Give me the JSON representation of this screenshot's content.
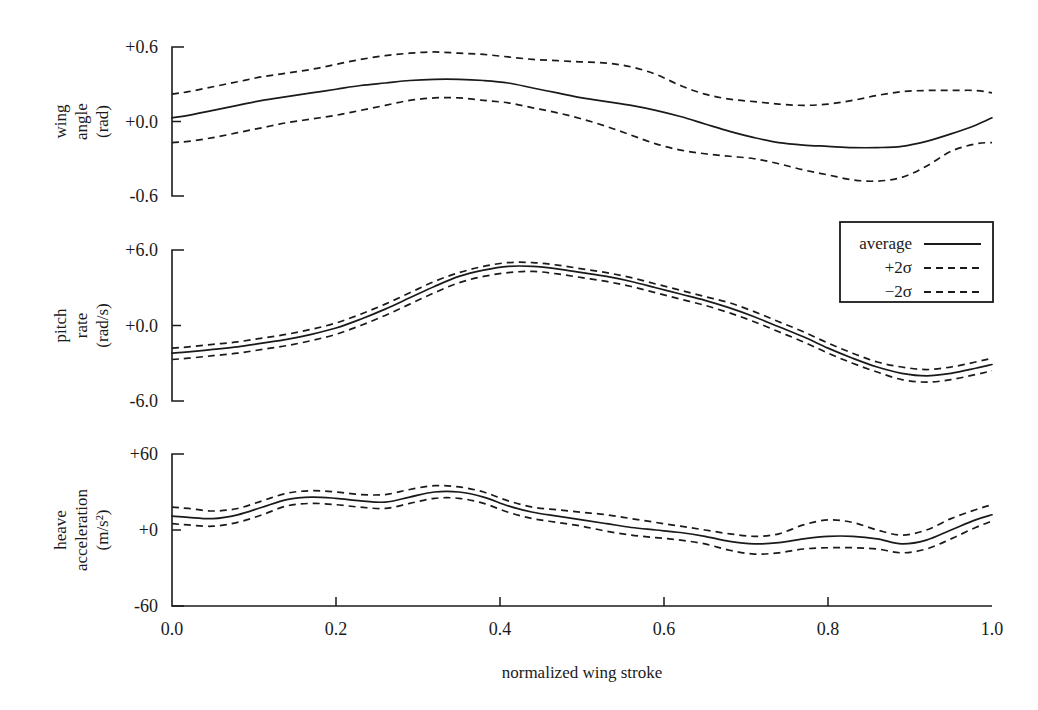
{
  "figure": {
    "background_color": "#ffffff",
    "line_color": "#1a1a1a",
    "xlabel": "normalized wing stroke"
  },
  "legend": {
    "position": "upper-right",
    "entries": [
      {
        "label": "average",
        "style": "solid"
      },
      {
        "label": "+2σ",
        "style": "dashed"
      },
      {
        "label": "−2σ",
        "style": "dashed"
      }
    ]
  },
  "chart_data": {
    "type": "line",
    "title": "",
    "xlabel": "normalized wing stroke",
    "xlim": [
      0.0,
      1.0
    ],
    "xticks": [
      0.0,
      0.2,
      0.4,
      0.6,
      0.8,
      1.0
    ],
    "xticklabels": [
      "0.0",
      "0.2",
      "0.4",
      "0.6",
      "0.8",
      "1.0"
    ],
    "grid": false,
    "legend_position": "upper-right",
    "panels": [
      {
        "name": "wing-angle",
        "ylabel_lines": [
          "wing",
          "angle",
          "(rad)"
        ],
        "ylabel": "wing angle (rad)",
        "units": "rad",
        "ylim": [
          -0.6,
          0.6
        ],
        "yticks": [
          -0.6,
          0.0,
          0.6
        ],
        "yticklabels": [
          "-0.6",
          "+0.0",
          "+0.6"
        ],
        "x": [
          0.0,
          0.02,
          0.05,
          0.08,
          0.11,
          0.14,
          0.17,
          0.2,
          0.23,
          0.26,
          0.29,
          0.32,
          0.35,
          0.38,
          0.41,
          0.44,
          0.47,
          0.5,
          0.53,
          0.56,
          0.59,
          0.62,
          0.65,
          0.68,
          0.71,
          0.74,
          0.77,
          0.8,
          0.83,
          0.86,
          0.89,
          0.92,
          0.95,
          0.98,
          1.0
        ],
        "series": [
          {
            "name": "average",
            "style": "solid",
            "values": [
              0.03,
              0.05,
              0.09,
              0.13,
              0.17,
              0.2,
              0.23,
              0.26,
              0.29,
              0.31,
              0.33,
              0.34,
              0.34,
              0.33,
              0.31,
              0.27,
              0.23,
              0.19,
              0.16,
              0.13,
              0.09,
              0.04,
              -0.02,
              -0.08,
              -0.13,
              -0.17,
              -0.19,
              -0.2,
              -0.21,
              -0.21,
              -0.2,
              -0.16,
              -0.1,
              -0.03,
              0.03
            ]
          },
          {
            "name": "+2σ",
            "style": "dashed",
            "values": [
              0.22,
              0.24,
              0.28,
              0.32,
              0.36,
              0.39,
              0.42,
              0.46,
              0.5,
              0.53,
              0.55,
              0.56,
              0.55,
              0.54,
              0.52,
              0.5,
              0.49,
              0.48,
              0.47,
              0.44,
              0.38,
              0.29,
              0.22,
              0.18,
              0.16,
              0.14,
              0.13,
              0.14,
              0.17,
              0.21,
              0.24,
              0.25,
              0.25,
              0.25,
              0.23
            ]
          },
          {
            "name": "−2σ",
            "style": "dashed",
            "values": [
              -0.17,
              -0.16,
              -0.13,
              -0.09,
              -0.05,
              -0.01,
              0.02,
              0.05,
              0.09,
              0.13,
              0.17,
              0.19,
              0.19,
              0.17,
              0.15,
              0.11,
              0.07,
              0.02,
              -0.04,
              -0.11,
              -0.18,
              -0.23,
              -0.26,
              -0.28,
              -0.3,
              -0.34,
              -0.39,
              -0.43,
              -0.47,
              -0.48,
              -0.45,
              -0.36,
              -0.24,
              -0.18,
              -0.17
            ]
          }
        ]
      },
      {
        "name": "pitch-rate",
        "ylabel_lines": [
          "pitch",
          "rate",
          "(rad/s)"
        ],
        "ylabel": "pitch rate (rad/s)",
        "units": "rad/s",
        "ylim": [
          -6.0,
          6.0
        ],
        "yticks": [
          -6.0,
          0.0,
          6.0
        ],
        "yticklabels": [
          "-6.0",
          "+0.0",
          "+6.0"
        ],
        "x": [
          0.0,
          0.02,
          0.05,
          0.08,
          0.11,
          0.14,
          0.17,
          0.2,
          0.23,
          0.26,
          0.29,
          0.32,
          0.35,
          0.38,
          0.41,
          0.44,
          0.47,
          0.5,
          0.53,
          0.56,
          0.59,
          0.62,
          0.65,
          0.68,
          0.71,
          0.74,
          0.77,
          0.8,
          0.83,
          0.86,
          0.89,
          0.92,
          0.95,
          0.98,
          1.0
        ],
        "series": [
          {
            "name": "average",
            "style": "solid",
            "values": [
              -2.2,
              -2.1,
              -1.9,
              -1.7,
              -1.4,
              -1.1,
              -0.7,
              -0.2,
              0.5,
              1.3,
              2.2,
              3.1,
              3.9,
              4.4,
              4.7,
              4.7,
              4.5,
              4.2,
              3.9,
              3.5,
              3.0,
              2.5,
              2.0,
              1.4,
              0.7,
              -0.1,
              -0.9,
              -1.8,
              -2.6,
              -3.3,
              -3.8,
              -4.0,
              -3.8,
              -3.4,
              -3.1
            ]
          },
          {
            "name": "+2σ",
            "style": "dashed",
            "values": [
              -1.8,
              -1.7,
              -1.5,
              -1.3,
              -1.0,
              -0.7,
              -0.3,
              0.2,
              0.9,
              1.7,
              2.6,
              3.5,
              4.2,
              4.7,
              5.0,
              5.0,
              4.8,
              4.5,
              4.2,
              3.8,
              3.3,
              2.8,
              2.3,
              1.8,
              1.1,
              0.3,
              -0.5,
              -1.4,
              -2.2,
              -2.9,
              -3.3,
              -3.5,
              -3.3,
              -2.9,
              -2.6
            ]
          },
          {
            "name": "−2σ",
            "style": "dashed",
            "values": [
              -2.7,
              -2.6,
              -2.4,
              -2.2,
              -1.9,
              -1.6,
              -1.2,
              -0.7,
              0.0,
              0.8,
              1.7,
              2.6,
              3.4,
              3.9,
              4.2,
              4.3,
              4.1,
              3.8,
              3.5,
              3.1,
              2.6,
              2.1,
              1.6,
              1.0,
              0.3,
              -0.5,
              -1.3,
              -2.2,
              -3.0,
              -3.7,
              -4.3,
              -4.5,
              -4.3,
              -3.9,
              -3.6
            ]
          }
        ]
      },
      {
        "name": "heave-acceleration",
        "ylabel_lines": [
          "heave",
          "acceleration",
          "(m/s²)"
        ],
        "ylabel": "heave acceleration (m/s^2)",
        "units": "m/s^2",
        "ylim": [
          -60,
          60
        ],
        "yticks": [
          -60,
          0,
          60
        ],
        "yticklabels": [
          "-60",
          "+0",
          "+60"
        ],
        "x": [
          0.0,
          0.02,
          0.05,
          0.08,
          0.11,
          0.14,
          0.17,
          0.2,
          0.23,
          0.26,
          0.29,
          0.32,
          0.35,
          0.38,
          0.41,
          0.44,
          0.47,
          0.5,
          0.53,
          0.56,
          0.59,
          0.62,
          0.65,
          0.68,
          0.71,
          0.74,
          0.77,
          0.8,
          0.83,
          0.86,
          0.89,
          0.92,
          0.95,
          0.98,
          1.0
        ],
        "series": [
          {
            "name": "average",
            "style": "solid",
            "values": [
              11,
              10,
              9,
              12,
              18,
              24,
              26,
              25,
              23,
              22,
              26,
              30,
              30,
              26,
              19,
              14,
              11,
              8,
              5,
              2,
              0,
              -2,
              -5,
              -9,
              -11,
              -10,
              -7,
              -5,
              -5,
              -7,
              -11,
              -8,
              0,
              8,
              12
            ]
          },
          {
            "name": "+2σ",
            "style": "dashed",
            "values": [
              18,
              17,
              15,
              17,
              23,
              29,
              31,
              30,
              28,
              28,
              32,
              35,
              34,
              30,
              23,
              18,
              16,
              14,
              12,
              9,
              6,
              3,
              0,
              -3,
              -5,
              -3,
              4,
              8,
              6,
              0,
              -4,
              0,
              9,
              16,
              20
            ]
          },
          {
            "name": "−2σ",
            "style": "dashed",
            "values": [
              5,
              4,
              3,
              6,
              12,
              19,
              21,
              20,
              18,
              17,
              21,
              25,
              25,
              21,
              14,
              9,
              6,
              3,
              -1,
              -4,
              -6,
              -8,
              -11,
              -16,
              -19,
              -18,
              -15,
              -14,
              -14,
              -15,
              -18,
              -15,
              -7,
              2,
              7
            ]
          }
        ]
      }
    ]
  },
  "geometry": {
    "plot_left": 172,
    "plot_right": 992,
    "panel_tops": [
      47,
      250,
      454
    ],
    "panel_bottoms": [
      196,
      401,
      606
    ]
  }
}
